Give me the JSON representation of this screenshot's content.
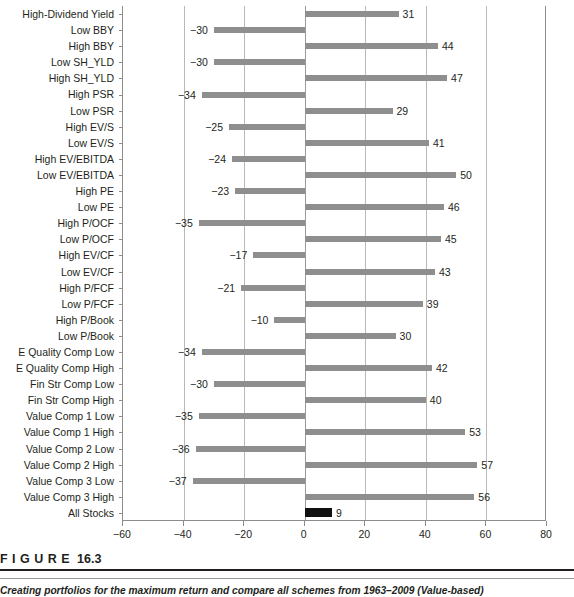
{
  "figure": {
    "head_label": "F I G U R E",
    "number": "16.3",
    "caption": "Creating portfolios for the maximum return and compare all schemes from 1963–2009 (Value-based)"
  },
  "chart_data": {
    "type": "bar",
    "orientation": "horizontal",
    "title": "",
    "xlabel": "",
    "ylabel": "",
    "xlim": [
      -60,
      80
    ],
    "xticks": [
      -60,
      -40,
      -20,
      0,
      20,
      40,
      60,
      80
    ],
    "grid": true,
    "legend": null,
    "bar_color": "#8e8e8e",
    "highlight_color": "#111111",
    "highlight_category": "All Stocks",
    "categories": [
      "High-Dividend Yield",
      "Low BBY",
      "High BBY",
      "Low SH_YLD",
      "High SH_YLD",
      "High PSR",
      "Low PSR",
      "High EV/S",
      "Low EV/S",
      "High EV/EBITDA",
      "Low EV/EBITDA",
      "High PE",
      "Low PE",
      "High P/OCF",
      "Low P/OCF",
      "High EV/CF",
      "Low EV/CF",
      "High P/FCF",
      "Low P/FCF",
      "High P/Book",
      "Low P/Book",
      "E Quality Comp Low",
      "E Quality Comp High",
      "Fin Str Comp Low",
      "Fin Str Comp High",
      "Value Comp 1 Low",
      "Value Comp 1 High",
      "Value Comp 2 Low",
      "Value Comp 2 High",
      "Value Comp 3 Low",
      "Value Comp 3 High",
      "All Stocks"
    ],
    "values": [
      31,
      -30,
      44,
      -30,
      47,
      -34,
      29,
      -25,
      41,
      -24,
      50,
      -23,
      46,
      -35,
      45,
      -17,
      43,
      -21,
      39,
      -10,
      30,
      -34,
      42,
      -30,
      40,
      -35,
      53,
      -36,
      57,
      -37,
      56,
      9
    ],
    "value_labels": [
      "31",
      "−30",
      "44",
      "−30",
      "47",
      "−34",
      "29",
      "−25",
      "41",
      "−24",
      "50",
      "−23",
      "46",
      "−35",
      "45",
      "−17",
      "43",
      "−21",
      "39",
      "−10",
      "30",
      "−34",
      "42",
      "−30",
      "40",
      "−35",
      "53",
      "−36",
      "57",
      "−37",
      "56",
      "9"
    ],
    "xtick_labels": [
      "−60",
      "−40",
      "−20",
      "0",
      "20",
      "40",
      "60",
      "80"
    ]
  }
}
